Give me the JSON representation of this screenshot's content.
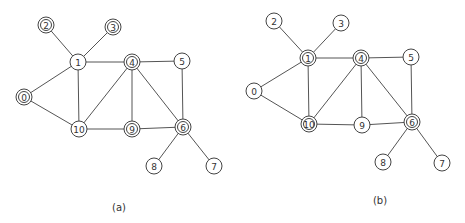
{
  "figure": {
    "panels": [
      {
        "id": "a",
        "caption": "(a)",
        "caption_pos": [
          119,
          207
        ],
        "nodes": [
          {
            "id": "0",
            "x": 24,
            "y": 97,
            "double": true
          },
          {
            "id": "1",
            "x": 78,
            "y": 62,
            "double": false
          },
          {
            "id": "2",
            "x": 46,
            "y": 25,
            "double": true
          },
          {
            "id": "3",
            "x": 113,
            "y": 27,
            "double": true
          },
          {
            "id": "4",
            "x": 132,
            "y": 62,
            "double": true
          },
          {
            "id": "5",
            "x": 182,
            "y": 61,
            "double": false
          },
          {
            "id": "6",
            "x": 183,
            "y": 127,
            "double": true
          },
          {
            "id": "7",
            "x": 214,
            "y": 166,
            "double": false
          },
          {
            "id": "8",
            "x": 154,
            "y": 166,
            "double": false
          },
          {
            "id": "9",
            "x": 132,
            "y": 129,
            "double": true
          },
          {
            "id": "10",
            "x": 79,
            "y": 129,
            "double": false
          }
        ]
      },
      {
        "id": "b",
        "caption": "(b)",
        "caption_pos": [
          380,
          200
        ],
        "nodes": [
          {
            "id": "0",
            "x": 254,
            "y": 91,
            "double": false
          },
          {
            "id": "1",
            "x": 308,
            "y": 58,
            "double": true
          },
          {
            "id": "2",
            "x": 274,
            "y": 21,
            "double": false
          },
          {
            "id": "3",
            "x": 341,
            "y": 23,
            "double": false
          },
          {
            "id": "4",
            "x": 361,
            "y": 58,
            "double": true
          },
          {
            "id": "5",
            "x": 411,
            "y": 57,
            "double": false
          },
          {
            "id": "6",
            "x": 412,
            "y": 122,
            "double": true
          },
          {
            "id": "7",
            "x": 442,
            "y": 163,
            "double": false
          },
          {
            "id": "8",
            "x": 383,
            "y": 162,
            "double": false
          },
          {
            "id": "9",
            "x": 362,
            "y": 125,
            "double": false
          },
          {
            "id": "10",
            "x": 309,
            "y": 124,
            "double": true
          }
        ]
      }
    ],
    "edges": [
      [
        "2",
        "1"
      ],
      [
        "3",
        "1"
      ],
      [
        "1",
        "0"
      ],
      [
        "1",
        "4"
      ],
      [
        "1",
        "10"
      ],
      [
        "0",
        "10"
      ],
      [
        "4",
        "5"
      ],
      [
        "4",
        "10"
      ],
      [
        "4",
        "9"
      ],
      [
        "4",
        "6"
      ],
      [
        "5",
        "6"
      ],
      [
        "10",
        "9"
      ],
      [
        "9",
        "6"
      ],
      [
        "6",
        "8"
      ],
      [
        "6",
        "7"
      ]
    ],
    "style": {
      "node_radius": 8,
      "inner_radius": 5.5,
      "stroke_color": "#444444",
      "edge_color": "#555555",
      "background": "#ffffff"
    }
  }
}
